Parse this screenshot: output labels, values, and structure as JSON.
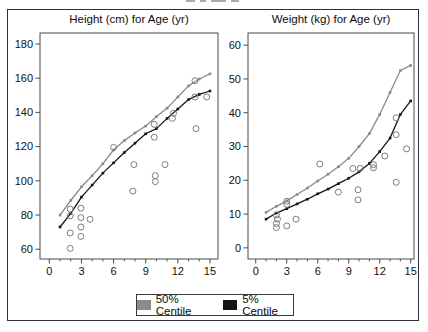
{
  "page": {
    "background": "#ffffff"
  },
  "figure_border_color": "#2e2e2e",
  "colors": {
    "centile50": "#8a8a8a",
    "centile5": "#141414",
    "observation": "#7d7d7d",
    "frame": "#4a4a4a",
    "text": "#111111"
  },
  "legend": {
    "items": [
      {
        "label": "50% Centile",
        "series": "centile50"
      },
      {
        "label": "5% Centile",
        "series": "centile5"
      }
    ]
  },
  "chart_data": [
    {
      "type": "line",
      "title": "Height (cm) for Age (yr)",
      "xlabel": "Age (yr)",
      "ylabel": "Height (cm)",
      "x": [
        1,
        2,
        3,
        4,
        5,
        6,
        7,
        8,
        9,
        10,
        11,
        12,
        13,
        14,
        15
      ],
      "series": [
        {
          "name": "50% Centile",
          "color": "centile50",
          "values": [
            80,
            88.5,
            96.5,
            103,
            110,
            118,
            123.5,
            128,
            132,
            137.5,
            142.5,
            149,
            155.5,
            159.5,
            162.5
          ]
        },
        {
          "name": "5% Centile",
          "color": "centile5",
          "values": [
            73,
            81,
            90.5,
            97.5,
            104.5,
            110.5,
            116.5,
            122,
            127.5,
            130.5,
            136.5,
            142,
            147.5,
            150.5,
            152.5
          ]
        }
      ],
      "observations": [
        [
          1.95,
          83.5
        ],
        [
          1.95,
          79.5
        ],
        [
          1.95,
          69.5
        ],
        [
          1.95,
          60.5
        ],
        [
          2.95,
          84
        ],
        [
          2.95,
          78.5
        ],
        [
          2.95,
          73
        ],
        [
          2.95,
          67.5
        ],
        [
          3.8,
          77.5
        ],
        [
          6,
          119.5
        ],
        [
          7.9,
          109.5
        ],
        [
          7.8,
          94
        ],
        [
          9.8,
          133
        ],
        [
          9.8,
          125.5
        ],
        [
          9.9,
          103
        ],
        [
          9.9,
          99.5
        ],
        [
          10.8,
          109.5
        ],
        [
          11.6,
          139.5
        ],
        [
          11.5,
          136.5
        ],
        [
          13.6,
          158.5
        ],
        [
          13.6,
          149
        ],
        [
          14.7,
          149
        ],
        [
          13.7,
          130.5
        ]
      ],
      "xticks": [
        0,
        3,
        6,
        9,
        12,
        15
      ],
      "minor_xticks": [
        1,
        2,
        4,
        5,
        7,
        8,
        10,
        11,
        13,
        14
      ],
      "yticks": [
        60,
        80,
        100,
        120,
        140,
        160,
        180
      ],
      "xlim": [
        -0.87,
        15.75
      ],
      "ylim": [
        54.3,
        186.4
      ],
      "grid": false,
      "legend_position": "bottom-shared"
    },
    {
      "type": "line",
      "title": "Weight (kg) for Age (yr)",
      "xlabel": "Age (yr)",
      "ylabel": "Weight (kg)",
      "x": [
        1,
        2,
        3,
        4,
        5,
        6,
        7,
        8,
        9,
        10,
        11,
        12,
        13,
        14,
        15
      ],
      "series": [
        {
          "name": "50% Centile",
          "color": "centile50",
          "values": [
            10.5,
            12.3,
            13.9,
            15.8,
            17.7,
            19.8,
            21.8,
            24,
            26.5,
            30,
            33.8,
            39.5,
            46,
            52.5,
            54
          ]
        },
        {
          "name": "5% Centile",
          "color": "centile5",
          "values": [
            8.5,
            10.3,
            11.6,
            13,
            14.4,
            16,
            17.4,
            19,
            20.6,
            22.5,
            25,
            28.5,
            32.5,
            39.5,
            43.5
          ]
        }
      ],
      "observations": [
        [
          2,
          9.7
        ],
        [
          2.1,
          8.5
        ],
        [
          2,
          7.2
        ],
        [
          2,
          6
        ],
        [
          3,
          13.8
        ],
        [
          3,
          12.9
        ],
        [
          3,
          6.5
        ],
        [
          3.9,
          8.5
        ],
        [
          6.2,
          24.8
        ],
        [
          8,
          16.5
        ],
        [
          9.4,
          23.5
        ],
        [
          10.1,
          23.5
        ],
        [
          9.9,
          17.2
        ],
        [
          9.9,
          14.2
        ],
        [
          11.4,
          24.6
        ],
        [
          11.4,
          23.7
        ],
        [
          12.5,
          27.2
        ],
        [
          13.6,
          38.5
        ],
        [
          13.6,
          33.5
        ],
        [
          14.6,
          29.3
        ],
        [
          13.6,
          19.4
        ]
      ],
      "xticks": [
        0,
        3,
        6,
        9,
        12,
        15
      ],
      "minor_xticks": [
        1,
        2,
        4,
        5,
        7,
        8,
        10,
        11,
        13,
        14
      ],
      "yticks": [
        0,
        10,
        20,
        30,
        40,
        50,
        60
      ],
      "xlim": [
        -0.75,
        15.32
      ],
      "ylim": [
        -3.3,
        63.6
      ],
      "grid": false,
      "legend_position": "bottom-shared"
    }
  ]
}
